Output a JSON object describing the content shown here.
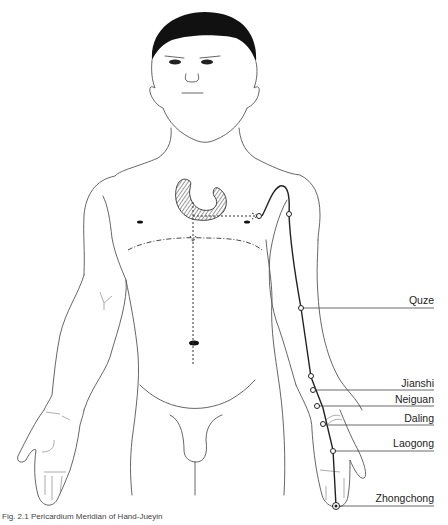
{
  "figure": {
    "title": "Pericardium Meridian of Hand-Jueyin",
    "caption": "Fig. 2.1 Pericardium Meridian of Hand-Jueyin",
    "colors": {
      "line": "#555555",
      "meridian": "#222222",
      "hair": "#111111",
      "background": "#ffffff"
    },
    "acupoints": [
      {
        "name": "Quze",
        "x": 301,
        "y": 308,
        "label_y": 294
      },
      {
        "name": "Jianshi",
        "x": 311,
        "y": 377,
        "label_y": 381
      },
      {
        "name": "Neiguan",
        "x": 316,
        "y": 390,
        "label_y": 398
      },
      {
        "name": "Daling",
        "x": 323,
        "y": 408,
        "label_y": 416
      },
      {
        "name": "Laogong",
        "x": 333,
        "y": 450,
        "label_y": 442
      },
      {
        "name": "Zhongchong",
        "x": 336,
        "y": 506,
        "label_y": 498
      }
    ],
    "internal_markers": {
      "heart_region": "hatched-heart",
      "chest_origin_point": "Tianchi"
    }
  }
}
